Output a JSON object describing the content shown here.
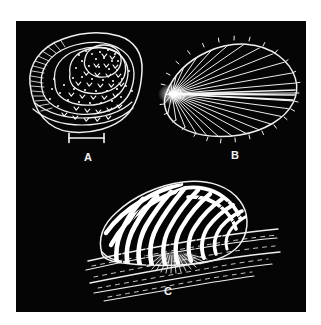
{
  "plate": {
    "page_background": "#ffffff",
    "panel_background": "#050505",
    "ink_color": "#f2f2f2",
    "panel": {
      "x": 16,
      "y": 21,
      "width": 290,
      "height": 291
    }
  },
  "figures": [
    {
      "id": "A",
      "label": "A",
      "name": "spiral-whorled-shell",
      "description": "Dorsal view of a rounded limpet-like shell with concentric whorl bands, stippled dots and chevron markings, and fine radial ribs along the left flank",
      "label_position": {
        "x": 68,
        "y": 131
      }
    },
    {
      "id": "B",
      "label": "B",
      "name": "radially-ribbed-teardrop-shell",
      "description": "Teardrop or leaf shaped valve with numerous straight ribs radiating from a bright apex at the left, edge finely serrated by rib terminations",
      "label_position": {
        "x": 215,
        "y": 129
      }
    },
    {
      "id": "C",
      "label": "C",
      "name": "striped-shell-on-blade",
      "description": "Shell with bold wavy zebra-like stripes attached by a radiating fringe to a ribbon-like blade of seagrass",
      "label_position": {
        "x": 148,
        "y": 265
      }
    }
  ],
  "scale_bar": {
    "name": "scale-bar",
    "label": "",
    "x1": 53,
    "x2": 88,
    "y": 117,
    "style": "i-beam"
  }
}
